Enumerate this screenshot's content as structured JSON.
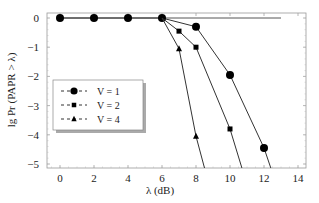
{
  "chart_data": {
    "type": "line",
    "title": "",
    "xlabel": "λ (dB)",
    "ylabel": "lg Pr (PAPR > λ)",
    "xlim": [
      -0.8,
      14.3
    ],
    "ylim": [
      -5.2,
      0.15
    ],
    "xticks": [
      0,
      2,
      4,
      6,
      8,
      10,
      12,
      14
    ],
    "yticks": [
      0,
      -1,
      -2,
      -3,
      -4,
      -5
    ],
    "grid": false,
    "legend_position": "left-middle",
    "reference_line": {
      "x": [
        0,
        13
      ],
      "y": [
        0,
        0
      ]
    },
    "series": [
      {
        "name": "V = 1",
        "marker": "circle",
        "x": [
          0,
          2,
          4,
          6,
          8,
          10,
          12,
          12.4
        ],
        "y": [
          0,
          0,
          0,
          0,
          -0.3,
          -1.95,
          -4.45,
          -5.2
        ],
        "marker_points": [
          0,
          1,
          2,
          3,
          4,
          5,
          6
        ]
      },
      {
        "name": "V = 2",
        "marker": "square",
        "x": [
          6,
          7,
          8,
          10,
          10.7
        ],
        "y": [
          0,
          -0.45,
          -1.0,
          -3.8,
          -5.2
        ],
        "marker_points": [
          1,
          2,
          3
        ]
      },
      {
        "name": "V = 4",
        "marker": "triangle",
        "x": [
          6,
          7,
          8,
          8.5
        ],
        "y": [
          0,
          -1.05,
          -4.05,
          -5.2
        ],
        "marker_points": [
          1,
          2
        ]
      }
    ]
  },
  "legend": {
    "items": [
      {
        "label": "V = 1",
        "marker": "circle"
      },
      {
        "label": "V = 2",
        "marker": "square"
      },
      {
        "label": "V = 4",
        "marker": "triangle"
      }
    ]
  },
  "axes": {
    "xlabel": "λ (dB)",
    "ylabel": "lg Pr (PAPR > λ)"
  }
}
